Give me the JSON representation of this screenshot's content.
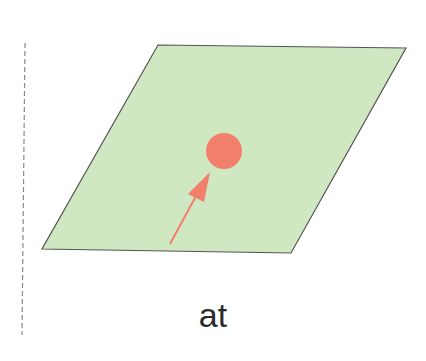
{
  "diagram": {
    "label": "at",
    "colors": {
      "plane_fill": "#cfe8c2",
      "plane_stroke": "#555555",
      "dot": "#f27f6b",
      "arrow": "#f27f6b",
      "divider": "#888888",
      "text": "#2b2b2b"
    },
    "elements": [
      "dashed-vertical-divider",
      "green-parallelogram-plane",
      "red-dot-on-plane",
      "red-arrow-pointing-to-dot"
    ]
  }
}
